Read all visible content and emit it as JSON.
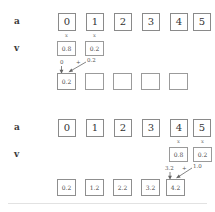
{
  "figure": {
    "divider_visible": true,
    "box_border_color": "#8a8a8a",
    "text_color": "#444444"
  },
  "panels": [
    {
      "id": "panel-top",
      "row_a": {
        "label": "a",
        "cells": [
          "0",
          "1",
          "2",
          "3",
          "4",
          "5"
        ]
      },
      "row_v": {
        "label": "v",
        "cells": [
          "0.8",
          "0.2"
        ],
        "markers": [
          "x",
          "x"
        ],
        "start_index": 0
      },
      "row_out": {
        "cells": [
          "0.2",
          "",
          "",
          "",
          ""
        ]
      },
      "annotation": {
        "left_term": "0",
        "operator": "+",
        "right_term": "0.2",
        "target_index": 0
      }
    },
    {
      "id": "panel-bottom",
      "row_a": {
        "label": "a",
        "cells": [
          "0",
          "1",
          "2",
          "3",
          "4",
          "5"
        ]
      },
      "row_v": {
        "label": "v",
        "cells": [
          "0.8",
          "0.2"
        ],
        "markers": [
          "x",
          "x"
        ],
        "start_index": 4
      },
      "row_out": {
        "cells": [
          "0.2",
          "1.2",
          "2.2",
          "3.2",
          "4.2"
        ]
      },
      "annotation": {
        "left_term": "3.2",
        "operator": "+",
        "right_term": "1.0",
        "target_index": 4
      }
    }
  ]
}
